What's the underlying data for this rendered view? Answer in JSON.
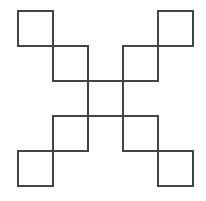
{
  "diagram": {
    "type": "x-shaped arrangement of squares",
    "stroke_color": "#444444",
    "background": "#ffffff",
    "square_size": 37,
    "origin": {
      "x": 17,
      "y": 10
    },
    "step": 35,
    "squares": [
      {
        "id": "top-left-outer",
        "col": 0,
        "row": 0
      },
      {
        "id": "top-left-inner",
        "col": 1,
        "row": 1
      },
      {
        "id": "center",
        "col": 2,
        "row": 2
      },
      {
        "id": "bottom-right-inner",
        "col": 3,
        "row": 3
      },
      {
        "id": "bottom-right-outer",
        "col": 4,
        "row": 4
      },
      {
        "id": "top-right-outer",
        "col": 4,
        "row": 0
      },
      {
        "id": "top-right-inner",
        "col": 3,
        "row": 1
      },
      {
        "id": "bottom-left-inner",
        "col": 1,
        "row": 3
      },
      {
        "id": "bottom-left-outer",
        "col": 0,
        "row": 4
      }
    ]
  }
}
